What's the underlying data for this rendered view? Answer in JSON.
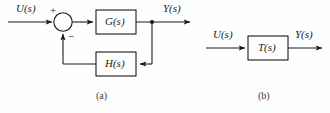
{
  "figure": {
    "type": "block-diagram",
    "background_color": "#fefefe",
    "line_color": "#1a1a1a"
  },
  "panel_a": {
    "caption": "(a)",
    "input_label": "U(s)",
    "output_label": "Y(s)",
    "summing_junction": {
      "name": "summing-junction",
      "plus_sign": "+",
      "minus_sign": "−"
    },
    "blocks": [
      {
        "label": "G(s)",
        "role": "forward-path"
      },
      {
        "label": "H(s)",
        "role": "feedback-path"
      }
    ]
  },
  "panel_b": {
    "caption": "(b)",
    "input_label": "U(s)",
    "output_label": "Y(s)",
    "blocks": [
      {
        "label": "T(s)",
        "role": "closed-loop-transfer-function"
      }
    ]
  }
}
